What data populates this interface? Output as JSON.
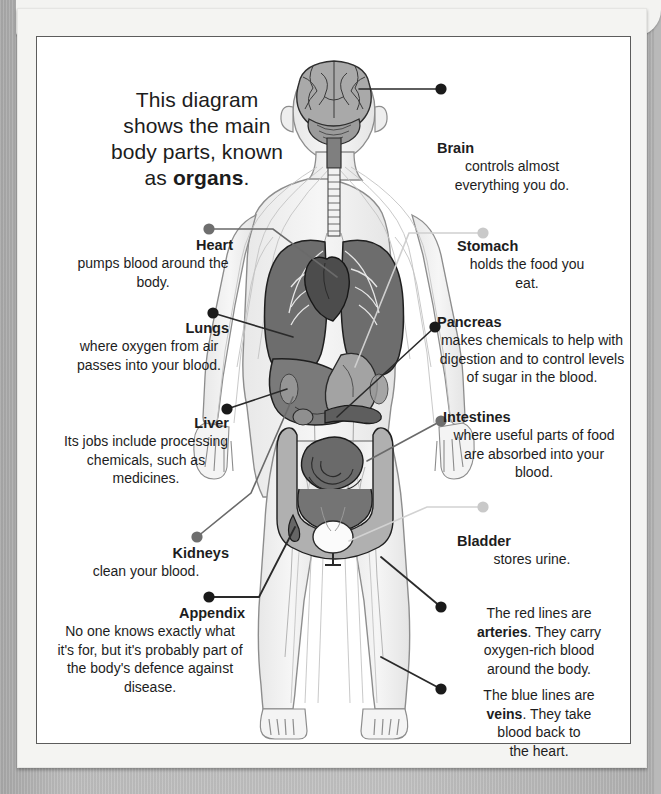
{
  "intro": {
    "line1": "This diagram",
    "line2": "shows the main",
    "line3": "body parts, known",
    "line4_pre": "as ",
    "line4_bold": "organs",
    "line4_post": "."
  },
  "colors": {
    "page_background": "#f4f4f2",
    "surround": "#b9b9b9",
    "text": "#1d1d1d",
    "dot_dark": "#1a1a1a",
    "dot_mid": "#6e6e6e",
    "dot_light": "#c9c9c9",
    "organ_lung": "#6d6d6d",
    "organ_liver": "#7a7a7a",
    "organ_intestine": "#8a8a8a",
    "organ_brain": "#a6a6a6",
    "body_fill": "#efefef"
  },
  "labels": {
    "brain": {
      "title": "Brain",
      "body": "controls almost everything you do.",
      "dot": "dark",
      "side": "right"
    },
    "stomach": {
      "title": "Stomach",
      "body": "holds the food you eat.",
      "dot": "light",
      "side": "right"
    },
    "pancreas": {
      "title": "Pancreas",
      "body": "makes chemicals to help with digestion and to control levels of sugar in the blood.",
      "dot": "dark",
      "side": "right"
    },
    "intestines": {
      "title": "Intestines",
      "body": "where useful parts of food are absorbed into your blood.",
      "dot": "mid",
      "side": "right"
    },
    "bladder": {
      "title": "Bladder",
      "body": "stores urine.",
      "dot": "light",
      "side": "right"
    },
    "heart": {
      "title": "Heart",
      "body": "pumps blood around the body.",
      "dot": "mid",
      "side": "left"
    },
    "lungs": {
      "title": "Lungs",
      "body": "where oxygen from air passes into your blood.",
      "dot": "dark",
      "side": "left"
    },
    "liver": {
      "title": "Liver",
      "body": "Its jobs include processing chemicals, such as medicines.",
      "dot": "dark",
      "side": "left"
    },
    "kidneys": {
      "title": "Kidneys",
      "body": "clean your blood.",
      "dot": "mid",
      "side": "left"
    },
    "appendix": {
      "title": "Appendix",
      "body": "No one knows exactly what it's for, but it's probably part of the body's defence against disease.",
      "dot": "dark",
      "side": "left"
    }
  },
  "vessels": {
    "arteries": {
      "line1": "The red lines are",
      "bold": "arteries",
      "line2_post": ". They carry",
      "line3": "oxygen-rich blood",
      "line4": "around the body.",
      "dot": "dark"
    },
    "veins": {
      "line1": "The blue lines are",
      "bold": "veins",
      "line2_post": ". They take",
      "line3": "blood back to",
      "line4": "the heart.",
      "dot": "dark"
    }
  },
  "figure": {
    "alt": "grayscale anatomical diagram of a human body showing internal organs and blood vessels"
  }
}
